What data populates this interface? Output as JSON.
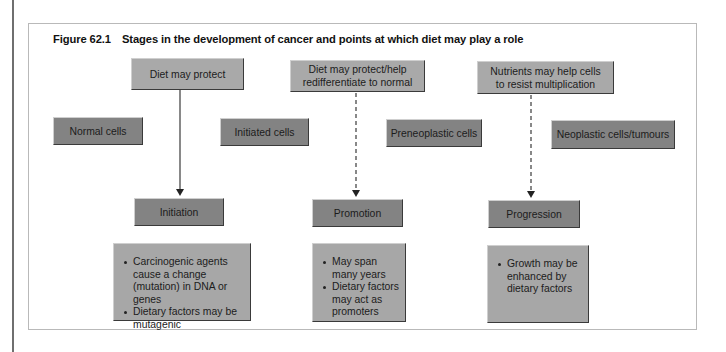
{
  "figure": {
    "number": "Figure 62.1",
    "title": "Stages in the development of cancer and points at which diet may play a role"
  },
  "diet_influences": [
    {
      "label": "Diet may protect",
      "arrow_style": "solid"
    },
    {
      "label": "Diet may protect/help redifferentiate to normal",
      "arrow_style": "dashed"
    },
    {
      "label": "Nutrients may help cells to resist multiplication",
      "arrow_style": "dashed"
    }
  ],
  "cell_states": [
    {
      "label": "Normal cells"
    },
    {
      "label": "Initiated cells"
    },
    {
      "label": "Preneoplastic cells"
    },
    {
      "label": "Neoplastic cells/tumours"
    }
  ],
  "stages": [
    {
      "label": "Initiation",
      "bullets": [
        "Carcinogenic agents cause a change (mutation) in DNA or genes",
        "Dietary factors may be mutagenic"
      ]
    },
    {
      "label": "Promotion",
      "bullets": [
        "May span many years",
        "Dietary factors may act as promoters"
      ]
    },
    {
      "label": "Progression",
      "bullets": [
        "Growth may be enhanced by dietary factors"
      ]
    }
  ],
  "colors": {
    "light_box": "#a9a9a9",
    "dark_box": "#838383",
    "figure_border": "#b9b9b9",
    "arrow": "#333333"
  }
}
